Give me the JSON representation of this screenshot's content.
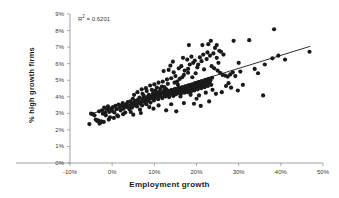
{
  "chart_data": {
    "type": "scatter",
    "title": "",
    "xlabel": "Employment growth",
    "ylabel": "% high growth firms",
    "annotation": "R² = 0.6201",
    "annotation_base": "R",
    "annotation_sup": "2",
    "annotation_rest": " = 0.6201",
    "grid": false,
    "legend": "none",
    "xlim": [
      -10,
      50
    ],
    "ylim": [
      0,
      9
    ],
    "xticks": [
      -10,
      0,
      10,
      20,
      30,
      40,
      50
    ],
    "xticklabels": [
      "-10%",
      "0%",
      "10%",
      "20%",
      "30%",
      "40%",
      "50%"
    ],
    "yticks": [
      0,
      1,
      2,
      3,
      4,
      5,
      6,
      7,
      8,
      9
    ],
    "yticklabels": [
      "0%",
      "1%",
      "2%",
      "3%",
      "4%",
      "5%",
      "6%",
      "7%",
      "8%",
      "9%"
    ],
    "marker": "filled-circle",
    "marker_color": "#1a1a1a",
    "marker_size": 2.1,
    "trendline": {
      "type": "linear",
      "color": "#1a1a1a",
      "x_start": -5.2,
      "y_start": 2.95,
      "x_end": 47.0,
      "y_end": 7.05
    },
    "points": [
      [
        -5.4,
        2.35
      ],
      [
        -4.6,
        2.95
      ],
      [
        -3.9,
        2.62
      ],
      [
        -3.6,
        2.55
      ],
      [
        -3.3,
        2.58
      ],
      [
        -3.1,
        3.12
      ],
      [
        -2.8,
        2.45
      ],
      [
        -2.6,
        2.52
      ],
      [
        -2.4,
        3.18
      ],
      [
        -2.2,
        2.98
      ],
      [
        -1.9,
        3.35
      ],
      [
        -1.7,
        3.05
      ],
      [
        -1.5,
        2.88
      ],
      [
        -1.2,
        3.22
      ],
      [
        -1.0,
        3.42
      ],
      [
        -0.7,
        3.08
      ],
      [
        -0.5,
        2.76
      ],
      [
        -0.3,
        3.28
      ],
      [
        0.0,
        3.15
      ],
      [
        0.2,
        3.38
      ],
      [
        0.5,
        3.05
      ],
      [
        0.8,
        3.45
      ],
      [
        1.0,
        3.25
      ],
      [
        1.2,
        2.88
      ],
      [
        1.5,
        3.52
      ],
      [
        1.8,
        3.32
      ],
      [
        2.0,
        3.18
      ],
      [
        2.2,
        3.48
      ],
      [
        2.5,
        3.62
      ],
      [
        2.7,
        3.28
      ],
      [
        2.9,
        3.42
      ],
      [
        3.1,
        3.05
      ],
      [
        3.3,
        3.55
      ],
      [
        3.5,
        3.38
      ],
      [
        3.7,
        3.68
      ],
      [
        3.9,
        3.45
      ],
      [
        4.1,
        3.25
      ],
      [
        4.3,
        3.72
      ],
      [
        4.5,
        3.52
      ],
      [
        4.7,
        3.35
      ],
      [
        4.9,
        3.88
      ],
      [
        5.1,
        3.62
      ],
      [
        5.3,
        3.48
      ],
      [
        5.5,
        3.75
      ],
      [
        5.7,
        3.55
      ],
      [
        5.9,
        3.42
      ],
      [
        6.1,
        3.82
      ],
      [
        6.3,
        3.65
      ],
      [
        6.5,
        3.95
      ],
      [
        6.7,
        3.58
      ],
      [
        6.9,
        3.72
      ],
      [
        7.1,
        3.48
      ],
      [
        7.3,
        3.88
      ],
      [
        7.5,
        4.05
      ],
      [
        7.7,
        3.68
      ],
      [
        7.9,
        3.82
      ],
      [
        8.1,
        3.55
      ],
      [
        8.3,
        3.98
      ],
      [
        8.5,
        3.75
      ],
      [
        8.7,
        4.12
      ],
      [
        8.9,
        3.88
      ],
      [
        9.1,
        3.65
      ],
      [
        9.3,
        4.02
      ],
      [
        9.5,
        3.92
      ],
      [
        9.7,
        4.22
      ],
      [
        9.9,
        3.78
      ],
      [
        10.1,
        4.08
      ],
      [
        10.3,
        3.95
      ],
      [
        10.5,
        4.28
      ],
      [
        10.7,
        4.05
      ],
      [
        10.9,
        3.85
      ],
      [
        11.1,
        4.15
      ],
      [
        11.3,
        4.32
      ],
      [
        11.5,
        4.02
      ],
      [
        11.7,
        4.18
      ],
      [
        11.9,
        3.92
      ],
      [
        12.1,
        4.25
      ],
      [
        12.3,
        4.38
      ],
      [
        12.5,
        4.08
      ],
      [
        12.7,
        4.22
      ],
      [
        12.9,
        4.45
      ],
      [
        13.1,
        4.12
      ],
      [
        13.3,
        4.28
      ],
      [
        13.5,
        3.98
      ],
      [
        13.7,
        4.35
      ],
      [
        13.9,
        4.18
      ],
      [
        14.1,
        4.42
      ],
      [
        14.3,
        4.25
      ],
      [
        14.5,
        4.05
      ],
      [
        14.7,
        4.32
      ],
      [
        14.9,
        4.48
      ],
      [
        15.1,
        4.15
      ],
      [
        15.3,
        4.38
      ],
      [
        15.5,
        4.22
      ],
      [
        15.7,
        4.52
      ],
      [
        15.9,
        4.28
      ],
      [
        16.1,
        4.42
      ],
      [
        16.3,
        4.18
      ],
      [
        16.5,
        4.55
      ],
      [
        16.7,
        4.35
      ],
      [
        16.9,
        4.48
      ],
      [
        17.1,
        4.25
      ],
      [
        17.3,
        4.62
      ],
      [
        17.5,
        4.38
      ],
      [
        17.7,
        4.52
      ],
      [
        17.9,
        4.28
      ],
      [
        18.1,
        4.68
      ],
      [
        18.3,
        4.45
      ],
      [
        18.5,
        4.58
      ],
      [
        18.7,
        4.32
      ],
      [
        18.9,
        4.72
      ],
      [
        19.1,
        4.48
      ],
      [
        19.3,
        4.65
      ],
      [
        19.5,
        4.38
      ],
      [
        19.7,
        4.82
      ],
      [
        19.9,
        4.55
      ],
      [
        20.1,
        4.72
      ],
      [
        20.3,
        4.45
      ],
      [
        20.5,
        4.88
      ],
      [
        20.7,
        4.62
      ],
      [
        20.9,
        4.78
      ],
      [
        21.1,
        4.52
      ],
      [
        21.3,
        4.95
      ],
      [
        21.5,
        4.68
      ],
      [
        21.7,
        4.85
      ],
      [
        21.9,
        4.58
      ],
      [
        22.1,
        5.02
      ],
      [
        22.3,
        4.75
      ],
      [
        22.5,
        4.92
      ],
      [
        22.7,
        4.65
      ],
      [
        22.9,
        5.08
      ],
      [
        23.1,
        4.82
      ],
      [
        23.3,
        4.98
      ],
      [
        23.5,
        4.72
      ],
      [
        23.7,
        5.15
      ],
      [
        5.2,
        4.12
      ],
      [
        6.0,
        4.28
      ],
      [
        7.0,
        4.45
      ],
      [
        8.0,
        4.52
      ],
      [
        9.0,
        4.68
      ],
      [
        10.0,
        4.75
      ],
      [
        11.0,
        4.85
      ],
      [
        12.0,
        4.92
      ],
      [
        13.0,
        5.05
      ],
      [
        14.0,
        5.12
      ],
      [
        15.0,
        5.25
      ],
      [
        16.0,
        5.08
      ],
      [
        17.0,
        5.32
      ],
      [
        18.0,
        5.45
      ],
      [
        19.0,
        5.18
      ],
      [
        12.2,
        5.55
      ],
      [
        13.4,
        5.62
      ],
      [
        14.6,
        5.48
      ],
      [
        15.8,
        5.72
      ],
      [
        16.4,
        5.85
      ],
      [
        17.2,
        5.58
      ],
      [
        18.4,
        5.95
      ],
      [
        19.2,
        6.05
      ],
      [
        20.2,
        5.78
      ],
      [
        21.2,
        6.15
      ],
      [
        17.8,
        6.25
      ],
      [
        18.8,
        6.42
      ],
      [
        19.6,
        6.18
      ],
      [
        20.8,
        6.38
      ],
      [
        21.6,
        6.55
      ],
      [
        22.4,
        6.28
      ],
      [
        23.2,
        6.48
      ],
      [
        24.0,
        6.62
      ],
      [
        24.8,
        6.35
      ],
      [
        25.4,
        6.78
      ],
      [
        18.2,
        7.12
      ],
      [
        22.8,
        7.18
      ],
      [
        24.4,
        6.95
      ],
      [
        25.8,
        6.72
      ],
      [
        26.4,
        6.55
      ],
      [
        23.6,
        5.85
      ],
      [
        24.2,
        5.72
      ],
      [
        25.0,
        5.58
      ],
      [
        25.6,
        5.45
      ],
      [
        26.2,
        5.32
      ],
      [
        26.8,
        5.28
      ],
      [
        27.4,
        5.22
      ],
      [
        28.0,
        5.35
      ],
      [
        28.6,
        5.48
      ],
      [
        29.2,
        5.25
      ],
      [
        27.0,
        4.65
      ],
      [
        27.6,
        4.82
      ],
      [
        28.2,
        4.55
      ],
      [
        28.8,
        7.38
      ],
      [
        30.4,
        5.52
      ],
      [
        30.0,
        6.05
      ],
      [
        31.0,
        4.72
      ],
      [
        32.5,
        7.42
      ],
      [
        33.8,
        5.68
      ],
      [
        34.6,
        5.42
      ],
      [
        35.8,
        4.08
      ],
      [
        36.2,
        5.95
      ],
      [
        38.4,
        8.08
      ],
      [
        38.0,
        6.32
      ],
      [
        39.4,
        6.48
      ],
      [
        41.0,
        6.25
      ],
      [
        46.8,
        6.72
      ],
      [
        29.8,
        4.38
      ],
      [
        26.0,
        4.28
      ],
      [
        21.0,
        3.45
      ],
      [
        15.2,
        3.12
      ],
      [
        12.8,
        3.18
      ],
      [
        19.4,
        3.58
      ],
      [
        23.0,
        3.72
      ],
      [
        24.6,
        4.18
      ],
      [
        20.0,
        3.88
      ],
      [
        17.0,
        3.62
      ],
      [
        14.0,
        3.55
      ],
      [
        11.0,
        3.48
      ],
      [
        8.8,
        3.38
      ],
      [
        6.6,
        3.22
      ],
      [
        4.4,
        3.08
      ],
      [
        2.6,
        2.95
      ],
      [
        1.4,
        2.82
      ],
      [
        0.4,
        2.72
      ],
      [
        -0.8,
        2.62
      ],
      [
        -2.0,
        2.48
      ],
      [
        -3.0,
        2.38
      ],
      [
        -4.2,
        2.88
      ],
      [
        -5.0,
        2.98
      ],
      [
        13.8,
        5.88
      ],
      [
        14.4,
        6.12
      ],
      [
        16.8,
        6.35
      ],
      [
        15.4,
        4.92
      ],
      [
        13.2,
        4.78
      ],
      [
        11.8,
        4.62
      ],
      [
        10.6,
        4.55
      ],
      [
        9.4,
        4.42
      ],
      [
        8.2,
        4.35
      ],
      [
        7.2,
        4.18
      ],
      [
        12.6,
        4.02
      ],
      [
        13.6,
        4.08
      ],
      [
        16.2,
        4.02
      ],
      [
        18.6,
        4.12
      ],
      [
        20.6,
        4.08
      ],
      [
        22.2,
        4.25
      ],
      [
        23.8,
        4.42
      ],
      [
        9.8,
        3.28
      ],
      [
        6.8,
        3.02
      ],
      [
        5.0,
        2.92
      ],
      [
        20.4,
        5.95
      ],
      [
        21.8,
        5.65
      ],
      [
        19.8,
        5.42
      ],
      [
        18.0,
        5.68
      ],
      [
        16.6,
        5.18
      ],
      [
        15.6,
        4.72
      ],
      [
        14.8,
        4.85
      ],
      [
        12.4,
        4.58
      ],
      [
        11.4,
        4.48
      ],
      [
        10.2,
        4.38
      ],
      [
        24.8,
        7.12
      ],
      [
        25.2,
        6.05
      ],
      [
        22.6,
        6.68
      ],
      [
        23.4,
        7.38
      ],
      [
        21.4,
        7.12
      ]
    ]
  }
}
